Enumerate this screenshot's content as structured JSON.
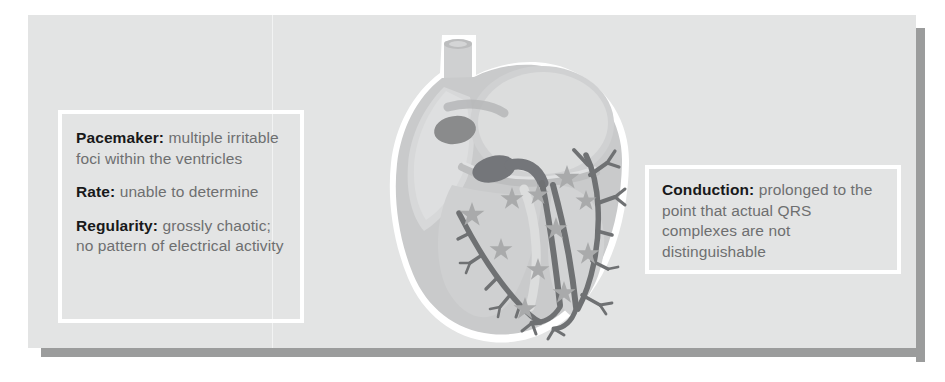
{
  "figure": {
    "type": "anatomical-illustration",
    "colors": {
      "panel_background": "#e3e4e4",
      "panel_shadow": "#9b9c9c",
      "callout_border": "#ffffff",
      "label_text": "#18191a",
      "body_text": "#6e6f70",
      "heart_outline": "#ffffff",
      "heart_muscle": "#c9cacb",
      "heart_chamber": "#d7d8d9",
      "conduction_path": "#6f7173",
      "node_dark": "#8a8b8c",
      "star_marker": "#a9aaab"
    }
  },
  "callouts": {
    "left": {
      "lines": [
        {
          "label": "Pacemaker:",
          "text": " multiple irritable foci within the ventricles"
        },
        {
          "label": "Rate:",
          "text": " unable to determine"
        },
        {
          "label": "Regularity:",
          "text": " grossly chaotic; no pattern of electrical activity"
        }
      ]
    },
    "right": {
      "lines": [
        {
          "label": "Conduction:",
          "text": " prolonged to the point that actual QRS complexes are not distinguishable"
        }
      ]
    }
  },
  "anatomy": {
    "structures": [
      "superior-vena-cava",
      "right-atrium",
      "left-atrium",
      "right-ventricle",
      "left-ventricle",
      "interventricular-septum",
      "sa-node",
      "av-node",
      "bundle-of-his",
      "right-bundle-branch",
      "left-bundle-branch",
      "purkinje-fibers"
    ],
    "ectopic_foci": {
      "count": 11,
      "marker": "star",
      "points": [
        {
          "x": 148,
          "y": 198,
          "r": 13
        },
        {
          "x": 188,
          "y": 182,
          "r": 12
        },
        {
          "x": 177,
          "y": 233,
          "r": 12
        },
        {
          "x": 214,
          "y": 253,
          "r": 12
        },
        {
          "x": 201,
          "y": 292,
          "r": 12
        },
        {
          "x": 240,
          "y": 276,
          "r": 12
        },
        {
          "x": 214,
          "y": 178,
          "r": 11
        },
        {
          "x": 243,
          "y": 161,
          "r": 13
        },
        {
          "x": 262,
          "y": 184,
          "r": 11
        },
        {
          "x": 232,
          "y": 212,
          "r": 12
        },
        {
          "x": 264,
          "y": 237,
          "r": 12
        }
      ]
    }
  }
}
